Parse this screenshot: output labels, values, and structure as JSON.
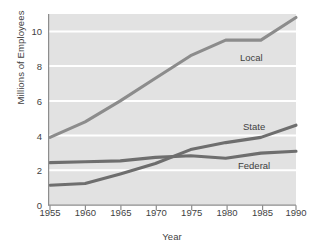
{
  "chart_data": {
    "type": "line",
    "title": "",
    "xlabel": "Year",
    "ylabel": "Millions of Employees",
    "xlim": [
      1955,
      1990
    ],
    "ylim": [
      0,
      11
    ],
    "xticks": [
      "1955",
      "1960",
      "1965",
      "1970",
      "1975",
      "1980",
      "1985",
      "1990"
    ],
    "yticks": [
      "0",
      "2",
      "4",
      "6",
      "8",
      "10"
    ],
    "grid": "horizontal",
    "legend_position": "inline-right",
    "x": [
      1955,
      1960,
      1965,
      1970,
      1975,
      1980,
      1985,
      1990
    ],
    "series": [
      {
        "name": "Local",
        "label": "Local",
        "color": "#8c8c8c",
        "values": [
          3.9,
          4.8,
          6.0,
          7.3,
          8.6,
          9.5,
          9.5,
          10.8
        ]
      },
      {
        "name": "State",
        "label": "State",
        "color": "#6e6e6e",
        "values": [
          1.15,
          1.25,
          1.8,
          2.4,
          3.2,
          3.6,
          3.9,
          4.6
        ]
      },
      {
        "name": "Federal",
        "label": "Federal",
        "color": "#6e6e6e",
        "values": [
          2.45,
          2.5,
          2.55,
          2.75,
          2.85,
          2.7,
          3.0,
          3.1
        ]
      }
    ],
    "plot_background": "#e2e2e2",
    "gridline_color": "#ffffff",
    "axis_color": "#9a9a9a",
    "text_color": "#3f3f3f"
  },
  "labels": {
    "y_axis": "Millions of Employees",
    "x_axis": "Year",
    "local": "Local",
    "state": "State",
    "federal": "Federal"
  },
  "yticks": {
    "t0": "0",
    "t2": "2",
    "t4": "4",
    "t6": "6",
    "t8": "8",
    "t10": "10"
  },
  "xticks": {
    "x1955": "1955",
    "x1960": "1960",
    "x1965": "1965",
    "x1970": "1970",
    "x1975": "1975",
    "x1980": "1980",
    "x1985": "1985",
    "x1990": "1990"
  }
}
